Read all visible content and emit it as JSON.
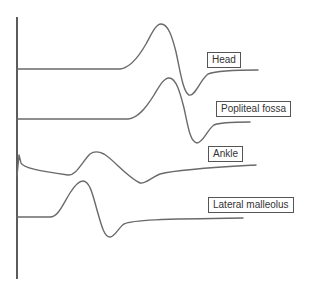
{
  "figure": {
    "colors": {
      "trace": "#6a6a6a",
      "axis": "#333333",
      "label_border": "#555555",
      "label_text": "#333333"
    },
    "traces": [
      {
        "name": "Head",
        "label": "Head"
      },
      {
        "name": "Popliteal fossa",
        "label": "Popliteal fossa"
      },
      {
        "name": "Ankle",
        "label": "Ankle"
      },
      {
        "name": "Lateral malleolus",
        "label": "Lateral malleolus"
      }
    ]
  }
}
